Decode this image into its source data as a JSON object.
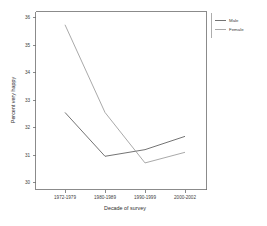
{
  "chart_data": {
    "type": "line",
    "title": "",
    "xlabel": "Decade of survey",
    "ylabel": "Percent very happy",
    "categories": [
      "1972-1979",
      "1980-1989",
      "1990-1999",
      "2000-2002"
    ],
    "series": [
      {
        "name": "Male",
        "values": [
          32.5,
          30.85,
          31.1,
          31.6
        ],
        "color": "#5a5a5a"
      },
      {
        "name": "Female",
        "values": [
          35.8,
          32.5,
          30.6,
          31.0
        ],
        "color": "#999999"
      }
    ],
    "ylim": [
      29.6,
      36.3
    ],
    "yticks": [
      30,
      31,
      32,
      33,
      34,
      35,
      36
    ],
    "ytick_labels": [
      "30",
      "31",
      "32",
      "33",
      "34",
      "35",
      "36"
    ],
    "xtick_labels": [
      "1972-1979",
      "1980-1989",
      "1990-1999",
      "2000-2002"
    ],
    "grid": false,
    "legend_position": "right-top",
    "legend_entries": [
      "Male",
      "Female"
    ]
  },
  "axes": {
    "y_title": "Percent very happy",
    "x_title": "Decade of survey"
  },
  "legend": {
    "items": [
      {
        "label": "Male"
      },
      {
        "label": "Female"
      }
    ]
  },
  "colors": {
    "male_line": "#5a5a5a",
    "female_line": "#999999",
    "frame": "#6e6e6e",
    "text": "#404040",
    "background": "#ffffff"
  }
}
